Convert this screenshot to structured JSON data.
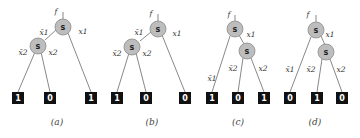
{
  "figure": {
    "node_label": "s",
    "function_label": "f",
    "panels": [
      {
        "caption": "(a)",
        "edge_labels": {
          "root_left": "x̄1",
          "root_right": "x1",
          "child_left": "x̄2",
          "child_right": "x2"
        },
        "terminals": [
          "1",
          "0",
          "1"
        ]
      },
      {
        "caption": "(b)",
        "edge_labels": {
          "root_left": "x̄1",
          "root_right": "x1",
          "child_left": "x̄2",
          "child_right": "x2"
        },
        "terminals": [
          "1",
          "0",
          "0"
        ]
      },
      {
        "caption": "(c)",
        "edge_labels": {
          "root_left": "x̄1",
          "root_right": "x1",
          "child_left": "x̄2",
          "child_right": "x2"
        },
        "terminals": [
          "1",
          "0",
          "1"
        ]
      },
      {
        "caption": "(d)",
        "edge_labels": {
          "root_left": "x̄1",
          "root_right": "x1",
          "child_left": "x̄2",
          "child_right": "x2"
        },
        "terminals": [
          "0",
          "1",
          "0"
        ]
      }
    ]
  }
}
